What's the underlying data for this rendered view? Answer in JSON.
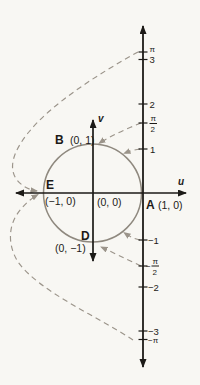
{
  "figure": {
    "colors": {
      "paper": "#f8f7f3",
      "ink": "#1c1a17",
      "circle_stroke": "#8f897f",
      "dashed_curve": "#9b948a"
    },
    "axes": {
      "u_label": "u",
      "v_label": "v"
    },
    "points": {
      "A": {
        "letter": "A",
        "coords": "(1, 0)"
      },
      "B": {
        "letter": "B",
        "coords": "(0, 1)"
      },
      "D": {
        "letter": "D",
        "coords": "(0, −1)"
      },
      "E": {
        "letter": "E",
        "coords": "(−1, 0)"
      },
      "origin": {
        "coords": "(0, 0)"
      }
    },
    "number_line": {
      "pi": "π",
      "three": "3",
      "two": "2",
      "pi_over_2_num": "π",
      "pi_over_2_den": "2",
      "one": "1",
      "minus_one": "−1",
      "minus_pi_over_2_sign": "−",
      "minus_pi_over_2_num": "π",
      "minus_pi_over_2_den": "2",
      "minus_two": "−2",
      "minus_three": "−3",
      "minus_pi": "−π"
    }
  }
}
